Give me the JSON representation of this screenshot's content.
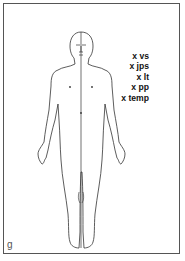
{
  "figure": {
    "panel_letter": "g",
    "hatched_side": "right",
    "markers": [
      {
        "label": "x vs"
      },
      {
        "label": "x jps"
      },
      {
        "label": "x lt"
      },
      {
        "label": "x pp"
      },
      {
        "label": "x temp"
      }
    ]
  },
  "colors": {
    "line": "#333333",
    "frame": "#555555",
    "background": "#ffffff"
  }
}
